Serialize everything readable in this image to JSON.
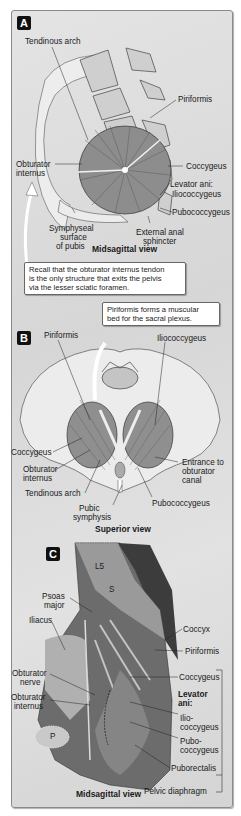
{
  "figure": {
    "panels": [
      {
        "id": "A",
        "badge": "A",
        "view_title": "Midsagittal view",
        "labels": {
          "tendinous_arch": "Tendinous arch",
          "piriformis": "Piriformis",
          "obturator_internus_1": "Obturator",
          "obturator_internus_2": "internus",
          "coccygeus": "Coccygeus",
          "levator_ani": "Levator ani:",
          "iliococcygeus": "Iliococcygeus",
          "pubococcygeus": "Pubococcygeus",
          "symphyseal_1": "Symphyseal",
          "symphyseal_2": "surface",
          "symphyseal_3": "of pubis",
          "external_anal_1": "External anal",
          "external_anal_2": "sphincter"
        },
        "callout": {
          "line1": "Recall that the obturator internus tendon",
          "line2": "is the only structure that exits the pelvis",
          "line3": "via the lesser sciatic foramen."
        }
      },
      {
        "id": "B",
        "badge": "B",
        "view_title": "Superior view",
        "callout": {
          "line1": "Piriformis forms a muscular",
          "line2": "bed for the sacral plexus."
        },
        "labels": {
          "piriformis": "Piriformis",
          "iliococcygeus": "Iliococcygeus",
          "coccygeus": "Coccygeus",
          "obturator_internus_1": "Obturator",
          "obturator_internus_2": "internus",
          "tendinous_arch": "Tendinous arch",
          "pubic_symphysis_1": "Pubic",
          "pubic_symphysis_2": "symphysis",
          "entrance_1": "Entrance to",
          "entrance_2": "obturator",
          "entrance_3": "canal",
          "pubococcygeus": "Pubococcygeus"
        }
      },
      {
        "id": "C",
        "badge": "C",
        "view_title": "Midsagittal view",
        "labels": {
          "l5": "L5",
          "s": "S",
          "p": "P",
          "psoas_1": "Psoas",
          "psoas_2": "major",
          "iliacus": "Iliacus",
          "coccyx": "Coccyx",
          "piriformis": "Piriformis",
          "obturator_nerve_1": "Obturator",
          "obturator_nerve_2": "nerve",
          "obturator_internus_1": "Obturator",
          "obturator_internus_2": "internus",
          "coccygeus": "Coccygeus",
          "levator_ani_1": "Levator",
          "levator_ani_2": "ani:",
          "ilio_1": "Ilio-",
          "ilio_2": "coccygeus",
          "pubo_1": "Pubo-",
          "pubo_2": "coccygeus",
          "puborectalis": "Puborectalis",
          "pelvic_diaphragm": "Pelvic diaphragm"
        }
      }
    ]
  }
}
